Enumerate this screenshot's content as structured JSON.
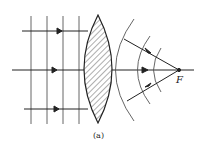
{
  "figure": {
    "caption": "(a)",
    "focal_label": "F",
    "colors": {
      "line": "#222222",
      "wavefront": "#555555",
      "hatch": "#333333",
      "background": "#ffffff"
    },
    "incoming_wavefronts_x": [
      31,
      47,
      63,
      79
    ],
    "incoming_rays_y": [
      31,
      70,
      109
    ],
    "focal_point": {
      "x": 179,
      "y": 70
    },
    "outgoing_wavefront_count": 3
  }
}
